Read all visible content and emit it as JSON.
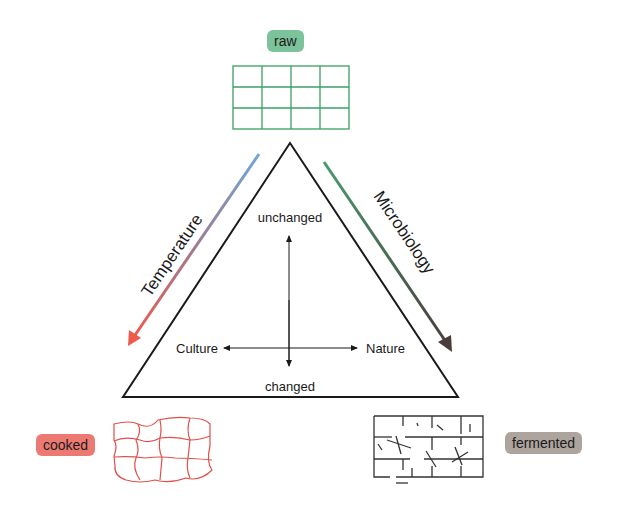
{
  "diagram": {
    "states": {
      "top": {
        "label": "raw",
        "color": "#7cc29b"
      },
      "left": {
        "label": "cooked",
        "color": "#ec7a72"
      },
      "right": {
        "label": "fermented",
        "color": "#aca49d"
      }
    },
    "axes": {
      "left_edge": {
        "label": "Temperature",
        "gradient": [
          "#6fa6d6",
          "#ef5a4c"
        ]
      },
      "right_edge": {
        "label": "Microbiology",
        "gradient": [
          "#4a9a6e",
          "#4a4040"
        ]
      }
    },
    "inner": {
      "top": "unchanged",
      "bottom": "changed",
      "left": "Culture",
      "right": "Nature"
    },
    "icons": {
      "raw": "grid-icon",
      "cooked": "deformed-grid-icon",
      "fermented": "broken-grid-icon"
    }
  }
}
